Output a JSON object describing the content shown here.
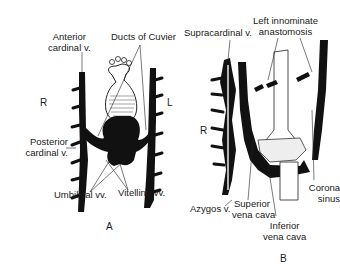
{
  "figure": {
    "panels": [
      {
        "id": "A",
        "panel_label": "A",
        "side_left": "R",
        "side_right": "L",
        "labels": {
          "anterior_cardinal": [
            "Anterior",
            "cardinal v."
          ],
          "ducts_of_cuvier": "Ducts of Cuvier",
          "posterior_cardinal": [
            "Posterior",
            "cardinal v."
          ],
          "umbilical": "Umbilical vv.",
          "vitelline": "Vitelline vv."
        }
      },
      {
        "id": "B",
        "panel_label": "B",
        "side_left": "R",
        "labels": {
          "supracardinal": "Supracardinal v.",
          "left_innominate": [
            "Left innominate",
            "anastomosis"
          ],
          "coronary_sinus": [
            "Corona",
            "sinus"
          ],
          "azygos": "Azygos v.",
          "superior_vena_cava": [
            "Superior",
            "vena cava"
          ],
          "inferior_vena_cava": [
            "Inferior",
            "vena cava"
          ]
        }
      }
    ],
    "colors": {
      "ink": "#111111",
      "background": "#ffffff",
      "outline": "#333333"
    }
  }
}
